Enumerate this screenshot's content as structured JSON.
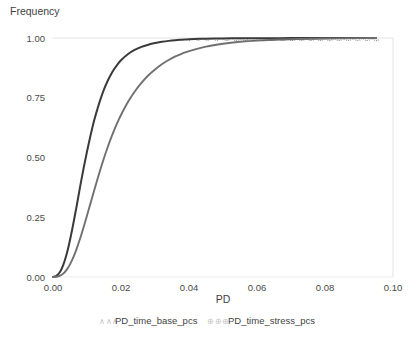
{
  "chart_data": {
    "type": "line",
    "title": "",
    "xlabel": "PD",
    "ylabel": "Frequency",
    "xlim": [
      0.0,
      0.1
    ],
    "ylim": [
      0.0,
      1.0
    ],
    "grid": "top-and-right-border-only",
    "legend_position": "bottom-center",
    "x_ticks": [
      "0.00",
      "0.02",
      "0.04",
      "0.06",
      "0.08",
      "0.10"
    ],
    "x_tick_values": [
      0.0,
      0.02,
      0.04,
      0.06,
      0.08,
      0.1
    ],
    "y_ticks": [
      "0.00",
      "0.25",
      "0.50",
      "0.75",
      "1.00"
    ],
    "y_tick_values": [
      0.0,
      0.25,
      0.5,
      0.75,
      1.0
    ],
    "series": [
      {
        "name": "PD_time_base_pcs",
        "color": "#3a3a3a",
        "marker_glyph": "∧∧∧",
        "x": [
          0.0,
          0.001,
          0.002,
          0.003,
          0.004,
          0.005,
          0.006,
          0.007,
          0.008,
          0.009,
          0.01,
          0.011,
          0.012,
          0.013,
          0.014,
          0.015,
          0.016,
          0.017,
          0.018,
          0.019,
          0.02,
          0.022,
          0.024,
          0.026,
          0.028,
          0.03,
          0.032,
          0.034,
          0.036,
          0.038,
          0.04,
          0.045,
          0.05,
          0.055,
          0.06,
          0.07,
          0.08,
          0.09,
          0.095
        ],
        "values": [
          0.0,
          0.005,
          0.02,
          0.05,
          0.095,
          0.155,
          0.225,
          0.3,
          0.38,
          0.455,
          0.525,
          0.59,
          0.65,
          0.7,
          0.745,
          0.785,
          0.818,
          0.846,
          0.87,
          0.89,
          0.907,
          0.932,
          0.95,
          0.963,
          0.972,
          0.979,
          0.984,
          0.988,
          0.991,
          0.993,
          0.995,
          0.997,
          0.998,
          0.9988,
          0.9992,
          0.9996,
          0.9998,
          0.9999,
          1.0
        ]
      },
      {
        "name": "PD_time_stress_pcs",
        "color": "#707070",
        "marker_glyph": "⊕⊕⊕",
        "x": [
          0.0,
          0.001,
          0.002,
          0.003,
          0.004,
          0.005,
          0.006,
          0.007,
          0.008,
          0.009,
          0.01,
          0.011,
          0.012,
          0.013,
          0.014,
          0.015,
          0.016,
          0.017,
          0.018,
          0.019,
          0.02,
          0.022,
          0.024,
          0.026,
          0.028,
          0.03,
          0.032,
          0.034,
          0.036,
          0.038,
          0.04,
          0.045,
          0.05,
          0.055,
          0.06,
          0.07,
          0.08,
          0.09,
          0.095
        ],
        "values": [
          0.0,
          0.001,
          0.005,
          0.014,
          0.03,
          0.053,
          0.083,
          0.12,
          0.162,
          0.208,
          0.257,
          0.307,
          0.357,
          0.406,
          0.453,
          0.498,
          0.54,
          0.579,
          0.615,
          0.648,
          0.678,
          0.731,
          0.775,
          0.812,
          0.843,
          0.868,
          0.89,
          0.908,
          0.923,
          0.935,
          0.945,
          0.964,
          0.976,
          0.984,
          0.989,
          0.995,
          0.998,
          0.9993,
          1.0
        ]
      }
    ]
  },
  "legend": {
    "items": [
      {
        "label": "PD_time_base_pcs",
        "marker": "series-marker-base"
      },
      {
        "label": "PD_time_stress_pcs",
        "marker": "series-marker-stress"
      }
    ]
  },
  "colors": {
    "base_series": "#3a3a3a",
    "stress_series": "#707070",
    "gridline": "#dcdcdc",
    "text": "#3f3f3f",
    "background": "#ffffff"
  }
}
